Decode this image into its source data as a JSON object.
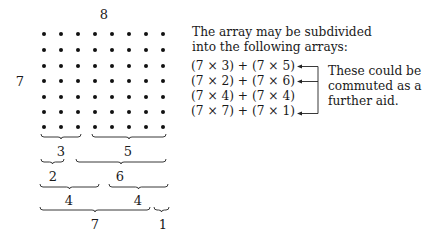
{
  "array": {
    "rows": 7,
    "cols": 8,
    "top_label": "8",
    "side_label": "7",
    "dot_x": [
      44,
      61,
      78,
      95,
      112,
      129,
      146,
      163
    ],
    "dot_y": [
      34,
      50,
      66,
      81,
      97,
      112,
      127
    ]
  },
  "braces": [
    {
      "label": "3",
      "x1": 41,
      "x2": 81,
      "y": 137,
      "label_x": 61,
      "label_y": 152
    },
    {
      "label": "5",
      "x1": 92,
      "x2": 166,
      "y": 137,
      "label_x": 128,
      "label_y": 152
    },
    {
      "label": "2",
      "x1": 41,
      "x2": 64,
      "y": 162,
      "label_x": 53,
      "label_y": 177
    },
    {
      "label": "6",
      "x1": 76,
      "x2": 166,
      "y": 162,
      "label_x": 120,
      "label_y": 177
    },
    {
      "label": "4",
      "x1": 40,
      "x2": 99,
      "y": 187,
      "label_x": 69,
      "label_y": 201
    },
    {
      "label": "4",
      "x1": 109,
      "x2": 168,
      "y": 187,
      "label_x": 138,
      "label_y": 201
    },
    {
      "label": "7",
      "x1": 40,
      "x2": 150,
      "y": 210,
      "label_x": 95,
      "label_y": 225
    },
    {
      "label": "1",
      "x1": 154,
      "x2": 169,
      "y": 210,
      "label_x": 163,
      "label_y": 225
    }
  ],
  "explanation": {
    "intro_line1": "The array may be subdivided",
    "intro_line2": "into the following arrays:",
    "equations": [
      "(7 × 3) + (7 × 5)",
      "(7 × 2) + (7 × 6)",
      "(7 × 4) + (7 × 4)",
      "(7 × 7) + (7 × 1)"
    ],
    "arrows_on_rows": [
      0,
      1,
      3
    ],
    "note_line1": "These could be",
    "note_line2": "commuted as a",
    "note_line3": "further aid."
  }
}
